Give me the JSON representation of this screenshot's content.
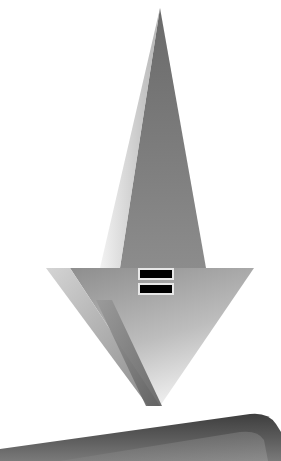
{
  "scene": {
    "width": 281,
    "height": 461,
    "background": "#ffffff",
    "description": "3D downward-pointing arrow with an equals symbol, above a rounded dark slab"
  },
  "arrow": {
    "icon": "down-arrow-icon",
    "tip_top": [
      160,
      8
    ],
    "wing_left": [
      46,
      268
    ],
    "wing_right": [
      254,
      268
    ],
    "tip_bottom": [
      160,
      406
    ],
    "colors": {
      "dark": "#6e6e6e",
      "mid": "#8a8a8a",
      "light": "#d8d8d8",
      "bevel": "#777777"
    }
  },
  "equals_symbol": {
    "icon": "equals-icon",
    "bar_color": "#000000",
    "border_color": "#e8e8e8"
  },
  "slab": {
    "icon": "slab-shape",
    "color_dark": "#4a4a4a",
    "color_light": "#8c8c8c"
  }
}
